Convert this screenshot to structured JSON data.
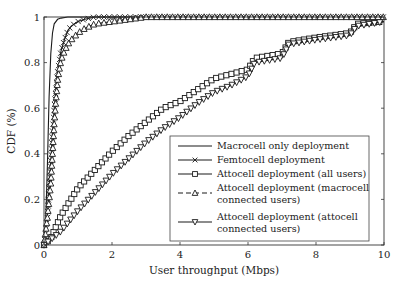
{
  "chart_data": {
    "type": "line",
    "title": "",
    "xlabel": "User throughput (Mbps)",
    "ylabel": "CDF (%)",
    "xlim": [
      0,
      10
    ],
    "ylim": [
      0,
      1
    ],
    "xticks": [
      0,
      2,
      4,
      6,
      8,
      10
    ],
    "yticks": [
      0,
      0.2,
      0.4,
      0.6,
      0.8,
      1
    ],
    "xtick_labels": [
      "0",
      "2",
      "4",
      "6",
      "8",
      "10"
    ],
    "ytick_labels": [
      "0",
      "0.2",
      "0.4",
      "0.6",
      "0.8",
      "1"
    ],
    "grid": false,
    "legend_position": "lower right",
    "series": [
      {
        "name": "Macrocell only deployment",
        "marker": "none",
        "linestyle": "solid",
        "x": [
          0,
          0.05,
          0.1,
          0.15,
          0.2,
          0.25,
          0.3,
          0.4,
          0.5,
          0.7,
          1.0,
          1.5,
          10
        ],
        "y": [
          0,
          0.1,
          0.35,
          0.65,
          0.84,
          0.93,
          0.97,
          0.99,
          0.995,
          1.0,
          1.0,
          1.0,
          1.0
        ]
      },
      {
        "name": "Femtocell deployment",
        "marker": "x",
        "linestyle": "solid",
        "x": [
          0,
          0.1,
          0.15,
          0.2,
          0.25,
          0.3,
          0.35,
          0.4,
          0.5,
          0.6,
          0.7,
          0.8,
          1.0,
          1.2,
          1.5,
          2.0,
          10
        ],
        "y": [
          0,
          0.12,
          0.25,
          0.37,
          0.5,
          0.6,
          0.68,
          0.76,
          0.85,
          0.9,
          0.94,
          0.96,
          0.98,
          0.99,
          1.0,
          1.0,
          1.0
        ]
      },
      {
        "name": "Attocell deployment (all users)",
        "marker": "square",
        "linestyle": "solid",
        "x": [
          0,
          0.2,
          0.5,
          1.0,
          1.5,
          2.0,
          2.5,
          3.0,
          3.5,
          4.0,
          4.5,
          5.0,
          5.5,
          6.0,
          6.2,
          7.0,
          7.2,
          8.0,
          8.5,
          9.0,
          9.2,
          10
        ],
        "y": [
          0,
          0.03,
          0.13,
          0.25,
          0.33,
          0.41,
          0.48,
          0.54,
          0.6,
          0.63,
          0.68,
          0.73,
          0.75,
          0.77,
          0.82,
          0.84,
          0.89,
          0.91,
          0.92,
          0.93,
          0.97,
          0.98
        ]
      },
      {
        "name": "Attocell deployment (macrocell connected users)",
        "marker": "triangle-up",
        "linestyle": "dashed",
        "x": [
          0,
          0.1,
          0.2,
          0.25,
          0.3,
          0.35,
          0.4,
          0.45,
          0.5,
          0.6,
          0.7,
          0.8,
          1.0,
          1.2,
          1.5,
          2.0,
          2.5,
          3.0,
          10
        ],
        "y": [
          0,
          0.12,
          0.27,
          0.4,
          0.53,
          0.63,
          0.72,
          0.77,
          0.81,
          0.85,
          0.88,
          0.9,
          0.93,
          0.95,
          0.97,
          0.98,
          0.99,
          1.0,
          1.0
        ]
      },
      {
        "name": "Attocell deployment (attocell connected users)",
        "marker": "triangle-down",
        "linestyle": "solid",
        "x": [
          0,
          0.5,
          1.0,
          1.5,
          2.0,
          2.5,
          3.0,
          3.5,
          4.0,
          4.5,
          5.0,
          5.5,
          6.0,
          6.2,
          7.0,
          7.2,
          8.0,
          8.5,
          9.0,
          9.2,
          10
        ],
        "y": [
          0,
          0.06,
          0.15,
          0.23,
          0.31,
          0.38,
          0.45,
          0.51,
          0.56,
          0.62,
          0.67,
          0.7,
          0.74,
          0.8,
          0.82,
          0.88,
          0.9,
          0.91,
          0.92,
          0.96,
          0.98
        ]
      }
    ]
  },
  "legend": {
    "items": [
      {
        "line1": "Macrocell only deployment",
        "line2": ""
      },
      {
        "line1": "Femtocell deployment",
        "line2": ""
      },
      {
        "line1": "Attocell deployment (all users)",
        "line2": ""
      },
      {
        "line1": "Attocell deployment (macrocell",
        "line2": "connected users)"
      },
      {
        "line1": "Attocell deployment (attocell",
        "line2": "connected users)"
      }
    ]
  },
  "colors": {
    "line": "#1a1a1a",
    "axis": "#333333",
    "background": "#ffffff"
  }
}
